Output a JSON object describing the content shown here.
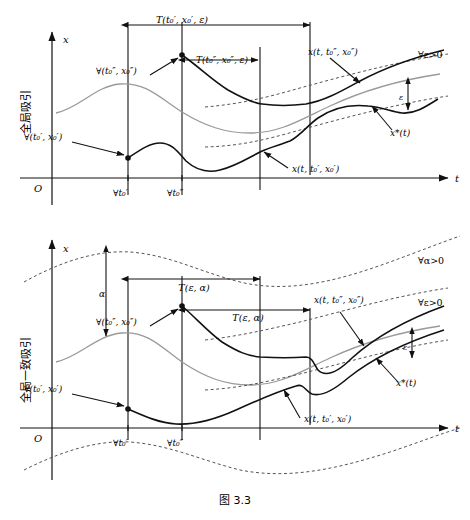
{
  "figure": {
    "caption": "图 3.3",
    "panels": [
      {
        "id": "top",
        "side_label": "全局吸引",
        "axis_x_label": "t",
        "axis_y_label": "x",
        "origin_label": "O",
        "tick_labels": [
          "∀t₀′",
          "∀t₀″"
        ],
        "annotations": {
          "span_top": "T(t₀′, x₀′, ε)",
          "span_inner": "T(t₀″, x₀″, ε)",
          "point_low": "∀(t₀′, x₀′)",
          "point_high": "∀(t₀″, x₀″)",
          "curve_upper": "x(t, t₀″, x₀″)",
          "curve_lower": "x(t, t₀′, x₀′)",
          "band": "∀ε>0",
          "equilibrium": "x*(t)",
          "gap": "ε"
        }
      },
      {
        "id": "bottom",
        "side_label": "全局一致吸引",
        "axis_x_label": "t",
        "axis_y_label": "x",
        "origin_label": "O",
        "tick_labels": [
          "∀t₀′",
          "∀t₀″"
        ],
        "annotations": {
          "span_top": "T(ε, α)",
          "span_inner": "T(ε, α)",
          "alpha": "α",
          "point_low": "∀(t₀′, x₀′)",
          "point_high": "∀(t₀″, x₀″)",
          "curve_upper": "x(t, t₀″, x₀″)",
          "curve_lower": "x(t, t₀′, x₀′)",
          "band_outer": "∀α>0",
          "band_inner": "∀ε>0",
          "equilibrium": "x*(t)",
          "gap": "ε"
        }
      }
    ]
  },
  "colors": {
    "ink": "#111111",
    "equilibrium": "#9a9a9a",
    "dashed": "#555555",
    "background": "#ffffff"
  }
}
